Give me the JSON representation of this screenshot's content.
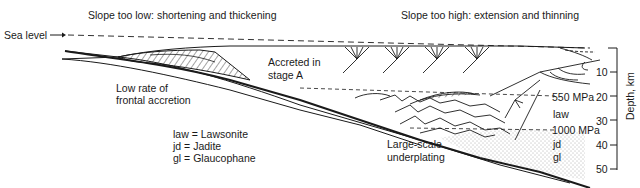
{
  "titles": {
    "left": "Slope too low: shortening and thickening",
    "right": "Slope too high: extension and thinning"
  },
  "labels": {
    "sea_level": "Sea level",
    "accreted_line1": "Accreted in",
    "accreted_line2": "stage A",
    "low_rate_line1": "Low rate of",
    "low_rate_line2": "frontal accretion",
    "underplating_line1": "Large-scale",
    "underplating_line2": "underplating",
    "pressure_550": "550 MPa",
    "pressure_1000": "1000 MPa",
    "law": "law",
    "jd": "jd",
    "gl": "gl"
  },
  "legend": [
    {
      "abbr": "law",
      "text": "law = Lawsonite"
    },
    {
      "abbr": "jd",
      "text": "jd = Jadite"
    },
    {
      "abbr": "gl",
      "text": "gl = Glaucophane"
    }
  ],
  "depth_axis": {
    "title": "Depth, km",
    "ticks": [
      "10",
      "20",
      "30",
      "40",
      "50"
    ]
  },
  "colors": {
    "line": "#1a1a1a",
    "background": "#ffffff"
  }
}
